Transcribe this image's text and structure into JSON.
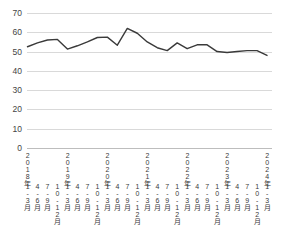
{
  "chart_data": {
    "type": "line",
    "title": "",
    "xlabel": "",
    "ylabel": "",
    "ylim": [
      0,
      70
    ],
    "ytick_interval": 10,
    "grid": true,
    "legend": false,
    "line_color": "#3a3a3a",
    "gridline_color": "#d9d9d9",
    "background_color": "#ffffff",
    "y_ticks": [
      "70",
      "60",
      "50",
      "40",
      "30",
      "20",
      "10",
      "0"
    ],
    "years": [
      {
        "label": "2018年",
        "quarters": [
          "1\n-\n3\n月",
          "4\n-\n6\n月",
          "7\n-\n9\n月",
          "10\n-\n12\n月"
        ]
      },
      {
        "label": "2019年",
        "quarters": [
          "1\n-\n3\n月",
          "4\n-\n6\n月",
          "7\n-\n9\n月",
          "10\n-\n12\n月"
        ]
      },
      {
        "label": "2020年",
        "quarters": [
          "1\n-\n3\n月",
          "4\n-\n6\n月",
          "7\n-\n9\n月",
          "10\n-\n12\n月"
        ]
      },
      {
        "label": "2021年",
        "quarters": [
          "1\n-\n3\n月",
          "4\n-\n6\n月",
          "7\n-\n9\n月",
          "10\n-\n12\n月"
        ]
      },
      {
        "label": "2022年",
        "quarters": [
          "1\n-\n3\n月",
          "4\n-\n6\n月",
          "7\n-\n9\n月",
          "10\n-\n12\n月"
        ]
      },
      {
        "label": "2023年",
        "quarters": [
          "1\n-\n3\n月",
          "4\n-\n6\n月",
          "7\n-\n9\n月",
          "10\n-\n12\n月"
        ]
      },
      {
        "label": "2024年",
        "quarters": [
          "1\n-\n3\n月"
        ]
      }
    ],
    "categories": [
      "2018年1-3月",
      "2018年4-6月",
      "2018年7-9月",
      "2018年10-12月",
      "2019年1-3月",
      "2019年4-6月",
      "2019年7-9月",
      "2019年10-12月",
      "2020年1-3月",
      "2020年4-6月",
      "2020年7-9月",
      "2020年10-12月",
      "2021年1-3月",
      "2021年4-6月",
      "2021年7-9月",
      "2021年10-12月",
      "2022年1-3月",
      "2022年4-6月",
      "2022年7-9月",
      "2022年10-12月",
      "2023年1-3月",
      "2023年4-6月",
      "2023年7-9月",
      "2023年10-12月",
      "2024年1-3月"
    ],
    "values": [
      52.5,
      54.5,
      56.0,
      56.3,
      51.3,
      53.0,
      55.0,
      57.3,
      57.5,
      53.3,
      62.0,
      59.5,
      55.0,
      52.0,
      50.5,
      54.5,
      51.5,
      53.5,
      53.5,
      50.0,
      49.5,
      50.0,
      50.5,
      50.5,
      48.0
    ]
  },
  "caption": {
    "text": ""
  }
}
